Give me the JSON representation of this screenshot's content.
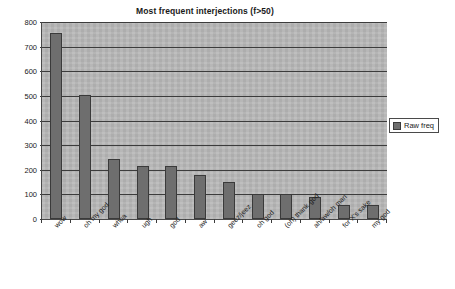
{
  "chart_data": {
    "type": "bar",
    "title": "Most frequent interjections (f>50)",
    "xlabel": "",
    "ylabel": "",
    "ylim": [
      0,
      800
    ],
    "ytick_step": 100,
    "yticks": [
      "0",
      "100",
      "200",
      "300",
      "400",
      "500",
      "600",
      "700",
      "800"
    ],
    "grid": true,
    "legend_position": "right",
    "categories": [
      "wow",
      "oh my god",
      "whoa",
      "ugh",
      "god",
      "aw",
      "geez/jeez",
      "oh god",
      "(oh) thank god",
      "ah/aw/oh man",
      "for X's sake",
      "my god"
    ],
    "series": [
      {
        "name": "Raw freq",
        "color": "#6e6e6e",
        "values": [
          755,
          505,
          242,
          216,
          217,
          177,
          152,
          103,
          100,
          88,
          57,
          58
        ]
      }
    ]
  },
  "legend": {
    "entries": [
      {
        "label": "Raw freq",
        "swatch": "legend-swatch-raw-freq"
      }
    ]
  },
  "colors": {
    "plot_background": "#b9b9b9",
    "gridline": "#3c3c3c",
    "bar_fill": "#6e6e6e",
    "bar_border": "#3a3a3a",
    "text": "#1a1a1a",
    "page_background": "#ffffff"
  }
}
